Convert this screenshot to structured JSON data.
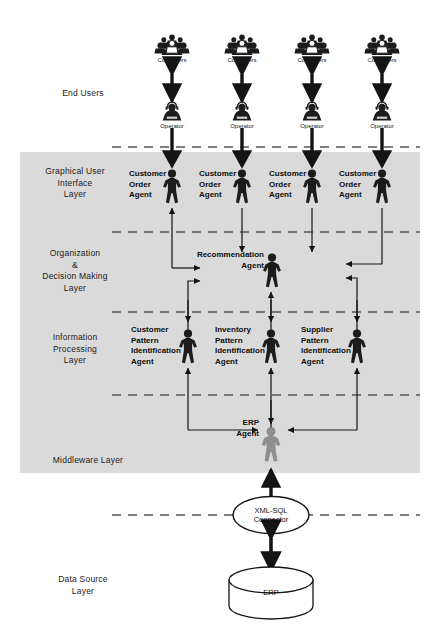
{
  "diagram": {
    "background_color": "#ffffff",
    "band_color": "#dedede",
    "figure_dark_color": "#1c1c1c",
    "figure_gray_color": "#8e8e8e",
    "dash_color": "#555555"
  },
  "layers": [
    {
      "id": "end-users",
      "label": "End Users"
    },
    {
      "id": "gui",
      "label": "Graphical User\nInterface\nLayer"
    },
    {
      "id": "org",
      "label": "Organization\n&\nDecision Making\nLayer"
    },
    {
      "id": "info",
      "label": "Information\nProcessing\nLayer"
    },
    {
      "id": "middleware",
      "label": "Middleware Layer"
    },
    {
      "id": "data-source",
      "label": "Data Source\nLayer"
    }
  ],
  "end_user_columns": [
    {
      "customers": "Customers",
      "operator": "Operator"
    },
    {
      "customers": "Customers",
      "operator": "Operator"
    },
    {
      "customers": "Customers",
      "operator": "Operator"
    },
    {
      "customers": "Customers",
      "operator": "Operator"
    }
  ],
  "gui_agents": [
    {
      "label": "Customer\nOrder\nAgent"
    },
    {
      "label": "Customer\nOrder\nAgent"
    },
    {
      "label": "Customer\nOrder\nAgent"
    },
    {
      "label": "Customer\nOrder\nAgent"
    }
  ],
  "org_agents": [
    {
      "label": "Recommendation\nAgent"
    }
  ],
  "info_agents": [
    {
      "label": "Customer\nPattern\nIdentification\nAgent"
    },
    {
      "label": "Inventory\nPattern\nIdentification\nAgent"
    },
    {
      "label": "Supplier\nPattern\nIdentification\nAgent"
    }
  ],
  "middleware_agents": [
    {
      "label": "ERP\nAgent"
    }
  ],
  "connector": {
    "label": "XML-SQL\nConnector"
  },
  "datastore": {
    "label": "ERP"
  }
}
